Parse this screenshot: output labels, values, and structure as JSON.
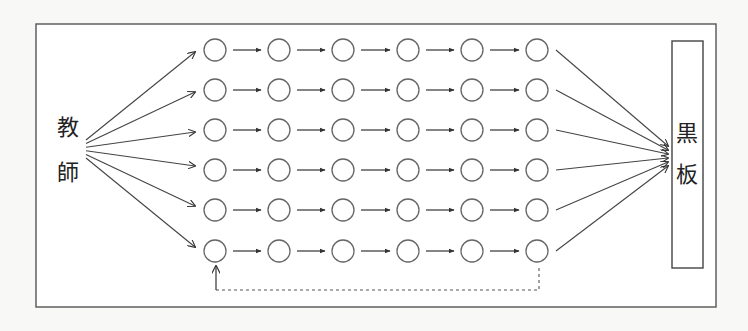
{
  "diagram": {
    "title": "",
    "source_label": {
      "line1": "教",
      "line2": "師"
    },
    "target_label": {
      "line1": "黒",
      "line2": "板"
    },
    "grid": {
      "rows": 6,
      "cols": 6,
      "col_x": [
        215,
        279,
        343,
        408,
        472,
        537
      ],
      "row_y": [
        50,
        90,
        130,
        170,
        210,
        251
      ],
      "node_radius": 11,
      "node_shape": "circle"
    },
    "edges": {
      "teacher_to_first_column": "arrow from 教師 to each circle in column 1",
      "row_chain": "arrow between consecutive circles in each row",
      "last_column_to_board": "arrow from each circle in column 6 to 黒板",
      "feedback": "dashed line from last circle of bottom row back to first circle of bottom row"
    },
    "colors": {
      "line": "#444444",
      "node_stroke": "#666666",
      "background": "#ffffff"
    }
  }
}
